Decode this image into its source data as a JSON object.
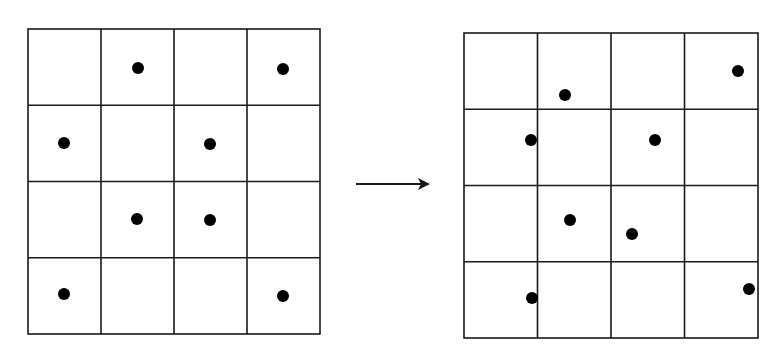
{
  "diagram": {
    "type": "grid-point-displacement",
    "colors": {
      "line": "#1a1a1a",
      "dot": "#000000",
      "background": "#ffffff"
    },
    "left_grid": {
      "rows": 4,
      "cols": 4,
      "x": 28,
      "y": 29,
      "width": 292,
      "height": 305,
      "dots": [
        {
          "x": 138,
          "y": 68
        },
        {
          "x": 283,
          "y": 69
        },
        {
          "x": 64,
          "y": 143
        },
        {
          "x": 210,
          "y": 144
        },
        {
          "x": 137,
          "y": 219
        },
        {
          "x": 210,
          "y": 220
        },
        {
          "x": 64,
          "y": 294
        },
        {
          "x": 283,
          "y": 296
        }
      ]
    },
    "arrow": {
      "x1": 356,
      "y1": 184,
      "x2": 430,
      "y2": 184
    },
    "right_grid": {
      "rows": 4,
      "cols": 4,
      "x": 464,
      "y": 33,
      "width": 294,
      "height": 305,
      "dots": [
        {
          "x": 565,
          "y": 95
        },
        {
          "x": 738,
          "y": 71
        },
        {
          "x": 531,
          "y": 140
        },
        {
          "x": 655,
          "y": 140
        },
        {
          "x": 570,
          "y": 220
        },
        {
          "x": 632,
          "y": 234
        },
        {
          "x": 532,
          "y": 298
        },
        {
          "x": 749,
          "y": 289
        }
      ]
    },
    "dot_radius": 6
  }
}
